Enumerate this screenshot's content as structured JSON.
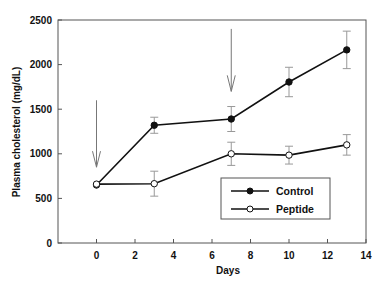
{
  "chart_data": {
    "type": "line",
    "title": "",
    "xlabel": "Days",
    "ylabel": "Plasma cholesterol (mg/dL)",
    "xlim": [
      -2,
      14
    ],
    "ylim": [
      0,
      2500
    ],
    "xticks": [
      0,
      2,
      4,
      6,
      8,
      10,
      12,
      14
    ],
    "yticks": [
      0,
      500,
      1000,
      1500,
      2000,
      2500
    ],
    "xtick_labels": [
      "0",
      "2",
      "4",
      "6",
      "8",
      "10",
      "12",
      "14"
    ],
    "ytick_labels": [
      "0",
      "500",
      "1000",
      "1500",
      "2000",
      "2500"
    ],
    "grid": false,
    "legend_position": "lower-right",
    "x": [
      0,
      3,
      7,
      10,
      13
    ],
    "series": [
      {
        "name": "Control",
        "marker": "filled-circle",
        "values": [
          650,
          1320,
          1390,
          1805,
          2165
        ],
        "errors": [
          0,
          90,
          140,
          165,
          210
        ]
      },
      {
        "name": "Peptide",
        "marker": "open-circle",
        "values": [
          660,
          665,
          1000,
          985,
          1100
        ],
        "errors": [
          0,
          140,
          130,
          100,
          115
        ]
      }
    ],
    "annotations": [
      {
        "type": "arrow-down",
        "x": 0,
        "label": ""
      },
      {
        "type": "arrow-down",
        "x": 7,
        "label": ""
      }
    ]
  }
}
